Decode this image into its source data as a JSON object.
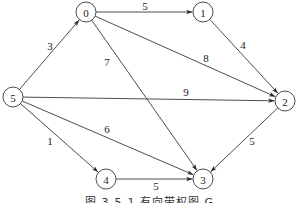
{
  "diagram": {
    "type": "directed-weighted-graph",
    "caption": "图 3-5-1   有向带权图 G",
    "colors": {
      "stroke": "#3a3a3a",
      "text": "#222222",
      "background": "#ffffff"
    },
    "node_radius": 10,
    "nodes": [
      {
        "id": "0",
        "label": "0",
        "x": 86,
        "y": 12
      },
      {
        "id": "1",
        "label": "1",
        "x": 203,
        "y": 12
      },
      {
        "id": "2",
        "label": "2",
        "x": 285,
        "y": 101
      },
      {
        "id": "3",
        "label": "3",
        "x": 203,
        "y": 179
      },
      {
        "id": "4",
        "label": "4",
        "x": 106,
        "y": 179
      },
      {
        "id": "5",
        "label": "5",
        "x": 13,
        "y": 97
      }
    ],
    "edges": [
      {
        "from": "5",
        "to": "0",
        "weight": "3",
        "label_x": 50,
        "label_y": 46
      },
      {
        "from": "0",
        "to": "1",
        "weight": "5",
        "label_x": 145,
        "label_y": 6
      },
      {
        "from": "0",
        "to": "2",
        "weight": "8",
        "label_x": 206,
        "label_y": 58
      },
      {
        "from": "0",
        "to": "3",
        "weight": "7",
        "label_x": 107,
        "label_y": 62
      },
      {
        "from": "1",
        "to": "2",
        "weight": "4",
        "label_x": 243,
        "label_y": 45
      },
      {
        "from": "5",
        "to": "2",
        "weight": "9",
        "label_x": 186,
        "label_y": 92
      },
      {
        "from": "5",
        "to": "3",
        "weight": "6",
        "label_x": 107,
        "label_y": 129
      },
      {
        "from": "5",
        "to": "4",
        "weight": "1",
        "label_x": 50,
        "label_y": 141
      },
      {
        "from": "4",
        "to": "3",
        "weight": "5",
        "label_x": 156,
        "label_y": 186
      },
      {
        "from": "2",
        "to": "3",
        "weight": "5",
        "label_x": 252,
        "label_y": 141
      }
    ]
  }
}
